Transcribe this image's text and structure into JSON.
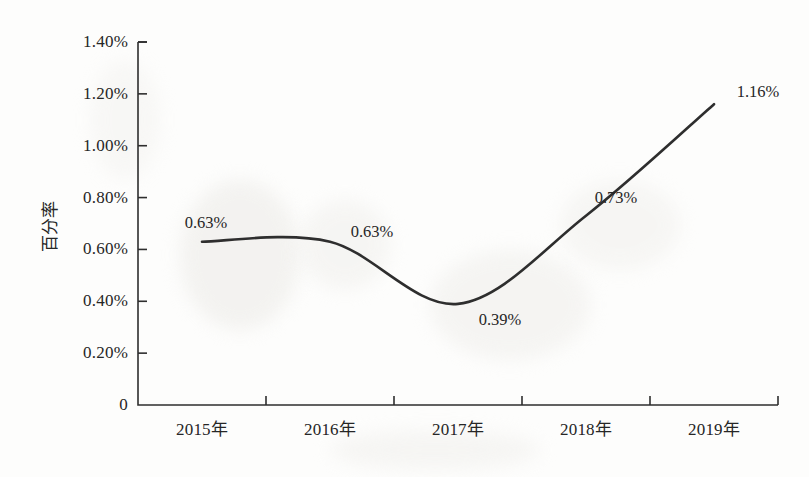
{
  "chart_data": {
    "type": "line",
    "title": "",
    "xlabel": "",
    "ylabel": "百分率",
    "categories": [
      "2015年",
      "2016年",
      "2017年",
      "2018年",
      "2019年"
    ],
    "values": [
      0.63,
      0.63,
      0.39,
      0.73,
      1.16
    ],
    "point_labels": [
      "0.63%",
      "0.63%",
      "0.39%",
      "0.73%",
      "1.16%"
    ],
    "ylim": [
      0,
      1.4
    ],
    "ytick_values": [
      0,
      0.2,
      0.4,
      0.6,
      0.8,
      1.0,
      1.2,
      1.4
    ],
    "ytick_labels": [
      "0",
      "0.20%",
      "0.40%",
      "0.60%",
      "0.80%",
      "1.00%",
      "1.20%",
      "1.40%"
    ],
    "grid": false,
    "legend": "none",
    "line_color": "#2e2e2e",
    "line_style": "smooth",
    "markers": false,
    "units": "percent"
  },
  "axes": {
    "y_title": "百分率"
  }
}
